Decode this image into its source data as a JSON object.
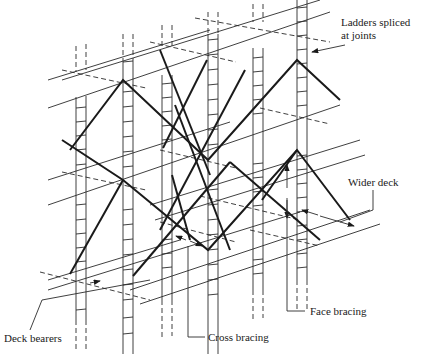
{
  "diagram": {
    "title": "",
    "labels": [
      {
        "id": "ladders",
        "line1": "Ladders spliced",
        "line2": "at joints",
        "x": 341,
        "y": 16
      },
      {
        "id": "wider_deck",
        "text": "Wider deck",
        "x": 348,
        "y": 176
      },
      {
        "id": "face_bracing",
        "text": "Face bracing",
        "x": 310,
        "y": 306
      },
      {
        "id": "cross_bracing",
        "text": "Cross bracing",
        "x": 208,
        "y": 330
      },
      {
        "id": "deck_bearers",
        "text": "Deck bearers",
        "x": 4,
        "y": 332
      }
    ],
    "colors": {
      "line": "#2a2a2a",
      "brace": "#1a1a1a",
      "background": "#ffffff"
    }
  }
}
